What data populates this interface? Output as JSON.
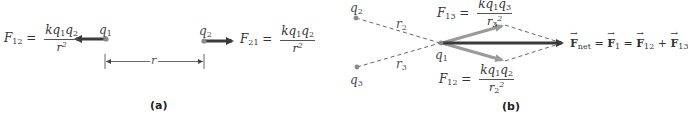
{
  "panel_a": {
    "caption": "(a)",
    "charges": [
      {
        "id": "q1",
        "symbol": "q",
        "subscript": "1"
      },
      {
        "id": "q2",
        "symbol": "q",
        "subscript": "2"
      }
    ],
    "distance_label": "r",
    "force_left": {
      "name": "F",
      "sub": "12",
      "equals": "=",
      "numerator_k": "kq",
      "numerator_s1": "1",
      "numerator_q": "q",
      "numerator_s2": "2",
      "denominator": "r",
      "denominator_exp": "2"
    },
    "force_right": {
      "name": "F",
      "sub": "21",
      "equals": "=",
      "numerator_k": "kq",
      "numerator_s1": "1",
      "numerator_q": "q",
      "numerator_s2": "2",
      "denominator": "r",
      "denominator_exp": "2"
    }
  },
  "panel_b": {
    "caption": "(b)",
    "charges": [
      {
        "id": "q1",
        "symbol": "q",
        "subscript": "1"
      },
      {
        "id": "q2",
        "symbol": "q",
        "subscript": "2"
      },
      {
        "id": "q3",
        "symbol": "q",
        "subscript": "3"
      }
    ],
    "distances": [
      {
        "symbol": "r",
        "subscript": "2"
      },
      {
        "symbol": "r",
        "subscript": "3"
      }
    ],
    "force_13": {
      "name": "F",
      "sub": "13",
      "equals": "=",
      "numerator_k": "kq",
      "numerator_s1": "1",
      "numerator_q": "q",
      "numerator_s2": "3",
      "denominator": "r",
      "denominator_sub": "3",
      "denominator_exp": "2"
    },
    "force_12": {
      "name": "F",
      "sub": "12",
      "equals": "=",
      "numerator_k": "kq",
      "numerator_s1": "1",
      "numerator_q": "q",
      "numerator_s2": "2",
      "denominator": "r",
      "denominator_sub": "2",
      "denominator_exp": "2"
    },
    "net_equation": {
      "t1": "F",
      "t1_sub": "net",
      "eq1": " = ",
      "t2": "F",
      "t2_sub": "1",
      "eq2": " = ",
      "t3": "F",
      "t3_sub": "12",
      "plus": " + ",
      "t4": "F",
      "t4_sub": "13"
    }
  },
  "colors": {
    "charge_dot": "#8a8a8a",
    "dark_arrow": "#3a3a3a",
    "light_arrow": "#9a9a9a",
    "dashed": "#555555",
    "text": "#333333"
  }
}
